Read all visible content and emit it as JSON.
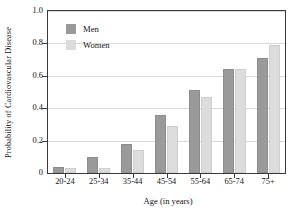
{
  "chart_data": {
    "type": "bar",
    "title": "",
    "xlabel": "Age (in years)",
    "ylabel": "Probability of Cardiovascular Disease",
    "categories": [
      "20-24",
      "25-34",
      "35-44",
      "45-54",
      "55-64",
      "65-74",
      "75+"
    ],
    "series": [
      {
        "name": "Men",
        "color": "#9a9a9a",
        "values": [
          0.04,
          0.1,
          0.18,
          0.36,
          0.51,
          0.64,
          0.71
        ]
      },
      {
        "name": "Women",
        "color": "#dcdcdc",
        "values": [
          0.03,
          0.03,
          0.14,
          0.29,
          0.47,
          0.64,
          0.79
        ]
      }
    ],
    "ylim": [
      0,
      1.0
    ],
    "yticks": [
      0,
      0.2,
      0.4,
      0.6,
      0.8,
      1.0
    ],
    "ytick_labels": [
      "0",
      "0.2",
      "0.4",
      "0.6",
      "0.8",
      "1.0"
    ],
    "grid": true,
    "legend_position": "top-left"
  },
  "legend": {
    "entries": [
      {
        "label": "Men"
      },
      {
        "label": "Women"
      }
    ]
  }
}
